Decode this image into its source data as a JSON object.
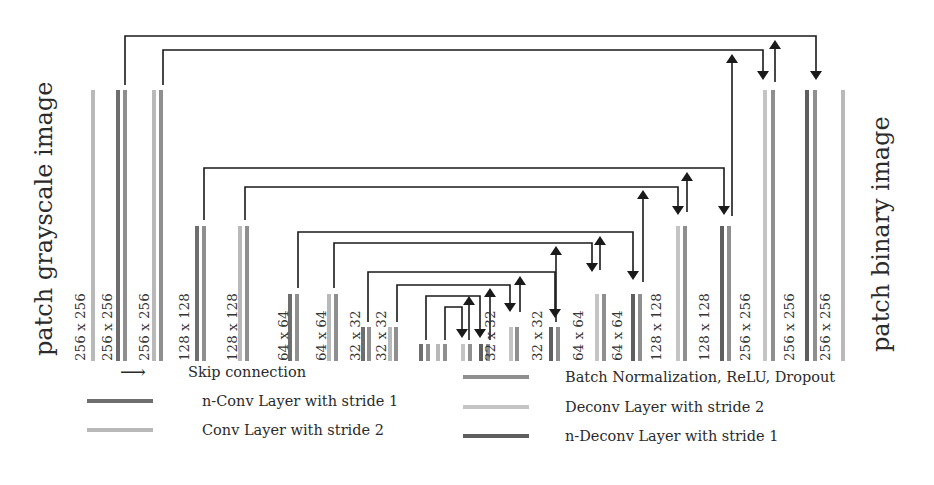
{
  "titles": {
    "input": "patch grayscale image",
    "output": "patch binary image"
  },
  "colors": {
    "nconv": "#6e6e6e",
    "conv2": "#b9b9b9",
    "bn": "#8f8f8f",
    "deconv2": "#c4c4c4",
    "ndeconv": "#5f5f5f",
    "arrow": "#1a1a1a"
  },
  "layers": [
    {
      "label": "256 x 256",
      "label_x": 80,
      "bars": [
        {
          "x": 93,
          "type": "conv2"
        }
      ],
      "top": 90
    },
    {
      "label": "256 x 256",
      "label_x": 107,
      "bars": [
        {
          "x": 118,
          "type": "nconv"
        },
        {
          "x": 125,
          "type": "bn"
        }
      ],
      "top": 90
    },
    {
      "label": "256 x 256",
      "label_x": 144,
      "bars": [
        {
          "x": 154,
          "type": "conv2"
        },
        {
          "x": 161,
          "type": "bn"
        }
      ],
      "top": 90
    },
    {
      "label": "128 x 128",
      "label_x": 184,
      "bars": [
        {
          "x": 197,
          "type": "nconv"
        },
        {
          "x": 204,
          "type": "bn"
        }
      ],
      "top": 226
    },
    {
      "label": "128 x 128",
      "label_x": 232,
      "bars": [
        {
          "x": 240,
          "type": "conv2"
        },
        {
          "x": 247,
          "type": "bn"
        }
      ],
      "top": 226
    },
    {
      "label": "64 x 64",
      "label_x": 283,
      "bars": [
        {
          "x": 290,
          "type": "nconv"
        },
        {
          "x": 297,
          "type": "bn"
        }
      ],
      "top": 294
    },
    {
      "label": "64 x 64",
      "label_x": 321,
      "bars": [
        {
          "x": 329,
          "type": "conv2"
        },
        {
          "x": 336,
          "type": "bn"
        }
      ],
      "top": 294
    },
    {
      "label": "32 x 32",
      "label_x": 355,
      "bars": [
        {
          "x": 363,
          "type": "nconv"
        },
        {
          "x": 369,
          "type": "bn"
        }
      ],
      "top": 327
    },
    {
      "label": "32 x 32",
      "label_x": 381,
      "bars": [
        {
          "x": 390,
          "type": "conv2"
        },
        {
          "x": 396,
          "type": "bn"
        }
      ],
      "top": 327
    },
    {
      "label": "",
      "label_x": 0,
      "bars": [
        {
          "x": 421,
          "type": "nconv"
        },
        {
          "x": 428,
          "type": "bn"
        }
      ],
      "top": 344
    },
    {
      "label": "",
      "label_x": 0,
      "bars": [
        {
          "x": 438,
          "type": "conv2"
        },
        {
          "x": 445,
          "type": "bn"
        }
      ],
      "top": 344
    },
    {
      "label": "",
      "label_x": 0,
      "bars": [
        {
          "x": 463,
          "type": "deconv2"
        },
        {
          "x": 470,
          "type": "bn"
        }
      ],
      "top": 344
    },
    {
      "label": "32 x 32",
      "label_x": 490,
      "bars": [
        {
          "x": 481,
          "type": "ndeconv"
        },
        {
          "x": 488,
          "type": "bn"
        }
      ],
      "top": 344
    },
    {
      "label": "",
      "label_x": 0,
      "bars": [
        {
          "x": 511,
          "type": "deconv2"
        },
        {
          "x": 517,
          "type": "bn"
        }
      ],
      "top": 327
    },
    {
      "label": "32 x 32",
      "label_x": 537,
      "bars": [
        {
          "x": 551,
          "type": "ndeconv"
        },
        {
          "x": 558,
          "type": "bn"
        }
      ],
      "top": 327
    },
    {
      "label": "64 x 64",
      "label_x": 578,
      "bars": [
        {
          "x": 597,
          "type": "deconv2"
        },
        {
          "x": 604,
          "type": "bn"
        }
      ],
      "top": 294
    },
    {
      "label": "64 x 64",
      "label_x": 617,
      "bars": [
        {
          "x": 633,
          "type": "ndeconv"
        },
        {
          "x": 640,
          "type": "bn"
        }
      ],
      "top": 294
    },
    {
      "label": "128 x 128",
      "label_x": 656,
      "bars": [
        {
          "x": 678,
          "type": "deconv2"
        },
        {
          "x": 685,
          "type": "bn"
        }
      ],
      "top": 226
    },
    {
      "label": "128 x 128",
      "label_x": 704,
      "bars": [
        {
          "x": 722,
          "type": "ndeconv"
        },
        {
          "x": 729,
          "type": "bn"
        }
      ],
      "top": 226
    },
    {
      "label": "256 x 256",
      "label_x": 745,
      "bars": [
        {
          "x": 765,
          "type": "deconv2"
        },
        {
          "x": 773,
          "type": "bn"
        }
      ],
      "top": 90
    },
    {
      "label": "256 x 256",
      "label_x": 789,
      "bars": [
        {
          "x": 807,
          "type": "ndeconv"
        },
        {
          "x": 815,
          "type": "bn"
        }
      ],
      "top": 90
    },
    {
      "label": "256 x 256",
      "label_x": 825,
      "bars": [
        {
          "x": 843,
          "type": "conv2"
        }
      ],
      "top": 90
    }
  ],
  "skips": [
    {
      "from_x": 125,
      "to_x": 816,
      "y": 36,
      "from_top": 85,
      "to_top": 80,
      "up_x": 775,
      "up_top": 82
    },
    {
      "from_x": 163,
      "to_x": 763,
      "y": 50,
      "from_top": 85,
      "to_top": 80,
      "up_x": 732,
      "up_top": 216
    },
    {
      "from_x": 204,
      "to_x": 724,
      "y": 168,
      "from_top": 220,
      "to_top": 215,
      "up_x": 687,
      "up_top": 212
    },
    {
      "from_x": 245,
      "to_x": 678,
      "y": 187,
      "from_top": 220,
      "to_top": 215,
      "up_x": 643,
      "up_top": 282
    },
    {
      "from_x": 298,
      "to_x": 633,
      "y": 232,
      "from_top": 288,
      "to_top": 280,
      "up_x": 600,
      "up_top": 270
    },
    {
      "from_x": 334,
      "to_x": 592,
      "y": 243,
      "from_top": 288,
      "to_top": 272,
      "up_x": 556,
      "up_top": 322
    },
    {
      "from_x": 368,
      "to_x": 555,
      "y": 272,
      "from_top": 322,
      "to_top": 318,
      "up_x": 520,
      "up_top": 312
    },
    {
      "from_x": 397,
      "to_x": 510,
      "y": 285,
      "from_top": 322,
      "to_top": 312,
      "up_x": 490,
      "up_top": 340
    },
    {
      "from_x": 426,
      "to_x": 480,
      "y": 296,
      "from_top": 340,
      "to_top": 338,
      "up_x": 469,
      "up_top": 340
    },
    {
      "from_x": 445,
      "to_x": 462,
      "y": 307,
      "from_top": 340,
      "to_top": 338,
      "up_x": null,
      "up_top": null
    }
  ],
  "up_arrows": [
    {
      "x": 775,
      "y_top": 40,
      "y_bottom": 82
    },
    {
      "x": 732,
      "y_top": 54,
      "y_bottom": 216
    },
    {
      "x": 687,
      "y_top": 172,
      "y_bottom": 212
    },
    {
      "x": 643,
      "y_top": 190,
      "y_bottom": 282
    },
    {
      "x": 600,
      "y_top": 236,
      "y_bottom": 270
    },
    {
      "x": 556,
      "y_top": 246,
      "y_bottom": 322
    },
    {
      "x": 520,
      "y_top": 276,
      "y_bottom": 312
    },
    {
      "x": 490,
      "y_top": 288,
      "y_bottom": 340
    },
    {
      "x": 469,
      "y_top": 296,
      "y_bottom": 340
    }
  ],
  "legend": {
    "items": [
      {
        "label": "Skip connection",
        "kind": "arrow",
        "x": 100,
        "y": 372
      },
      {
        "label": "n-Conv Layer with stride 1",
        "kind": "nconv",
        "x": 87,
        "y": 401
      },
      {
        "label": "Conv Layer with stride 2",
        "kind": "conv2",
        "x": 87,
        "y": 430
      },
      {
        "label": "Batch Normalization, ReLU, Dropout",
        "kind": "bn",
        "x": 463,
        "y": 377
      },
      {
        "label": "Deconv Layer with stride 2",
        "kind": "deconv2",
        "x": 463,
        "y": 407
      },
      {
        "label": "n-Deconv Layer with stride 1",
        "kind": "ndeconv",
        "x": 463,
        "y": 436
      }
    ]
  }
}
